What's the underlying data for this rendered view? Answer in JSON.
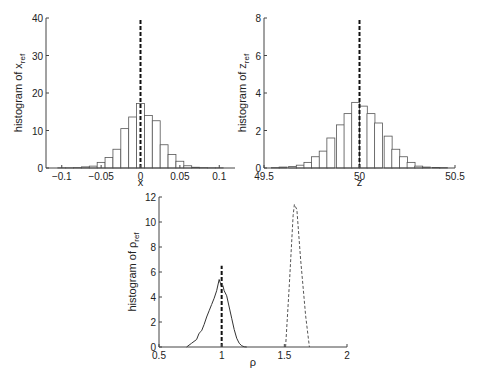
{
  "chart_data": [
    {
      "id": "hist_x",
      "type": "bar",
      "title": "",
      "xlabel": "x",
      "ylabel": "histogram of x",
      "ylabel_sub": "ref",
      "xlim": [
        -0.12,
        0.12
      ],
      "ylim": [
        0,
        40
      ],
      "xticks": [
        -0.1,
        -0.05,
        0,
        0.05,
        0.1
      ],
      "xtick_labels": [
        "-0.1",
        "-0.05",
        "0",
        "0.05",
        "0.1"
      ],
      "yticks": [
        0,
        10,
        20,
        30,
        40
      ],
      "ytick_labels": [
        "0",
        "10",
        "20",
        "30",
        "40"
      ],
      "grid": false,
      "bin_width": 0.01,
      "categories": [
        -0.1,
        -0.09,
        -0.08,
        -0.07,
        -0.06,
        -0.05,
        -0.04,
        -0.03,
        -0.02,
        -0.01,
        0,
        0.01,
        0.02,
        0.03,
        0.04,
        0.05,
        0.06,
        0.07,
        0.08,
        0.09,
        0.1
      ],
      "values": [
        0.05,
        0.05,
        0.1,
        0.3,
        0.5,
        1.5,
        2.8,
        5.0,
        10.5,
        13.6,
        17.2,
        14.0,
        12.6,
        6.2,
        3.6,
        1.8,
        0.6,
        0.2,
        0.1,
        0.05,
        0.05
      ],
      "reference_line": {
        "x": 0,
        "style": "dashed",
        "ymax": 40
      }
    },
    {
      "id": "hist_z",
      "type": "bar",
      "title": "",
      "xlabel": "z",
      "ylabel": "histogram of z",
      "ylabel_sub": "ref",
      "xlim": [
        49.5,
        50.5
      ],
      "ylim": [
        0,
        8
      ],
      "xticks": [
        49.5,
        50,
        50.5
      ],
      "xtick_labels": [
        "49.5",
        "50",
        "50.5"
      ],
      "yticks": [
        0,
        2,
        4,
        6,
        8
      ],
      "ytick_labels": [
        "0",
        "2",
        "4",
        "6",
        "8"
      ],
      "grid": false,
      "bin_width": 0.0417,
      "categories": [
        49.56,
        49.6,
        49.65,
        49.69,
        49.73,
        49.77,
        49.81,
        49.85,
        49.9,
        49.94,
        49.98,
        50.02,
        50.06,
        50.1,
        50.15,
        50.19,
        50.23,
        50.27,
        50.31,
        50.35,
        50.4,
        50.44
      ],
      "values": [
        0.02,
        0.05,
        0.08,
        0.15,
        0.3,
        0.6,
        0.9,
        1.6,
        2.3,
        2.9,
        3.5,
        3.3,
        2.9,
        2.4,
        1.7,
        1.0,
        0.6,
        0.3,
        0.1,
        0.05,
        0.03,
        0.02
      ],
      "reference_line": {
        "x": 50,
        "style": "dashed",
        "ymax": 8
      }
    },
    {
      "id": "hist_rho",
      "type": "line",
      "title": "",
      "xlabel": "ρ",
      "ylabel": "histogram of ρ",
      "ylabel_sub": "ref",
      "xlim": [
        0.5,
        2
      ],
      "ylim": [
        0,
        12
      ],
      "xticks": [
        0.5,
        1,
        1.5,
        2
      ],
      "xtick_labels": [
        "0.5",
        "1",
        "1.5",
        "2"
      ],
      "yticks": [
        0,
        2,
        4,
        6,
        8,
        10,
        12
      ],
      "ytick_labels": [
        "0",
        "2",
        "4",
        "6",
        "8",
        "10",
        "12"
      ],
      "grid": false,
      "series": [
        {
          "name": "solid",
          "style": "solid",
          "x": [
            0.72,
            0.76,
            0.8,
            0.82,
            0.84,
            0.86,
            0.88,
            0.9,
            0.92,
            0.94,
            0.96,
            0.98,
            0.99,
            1.0,
            1.01,
            1.02,
            1.04,
            1.06,
            1.08,
            1.1,
            1.12,
            1.14,
            1.16,
            1.18,
            1.2
          ],
          "y": [
            0.0,
            0.3,
            0.6,
            1.1,
            1.3,
            1.8,
            2.4,
            2.9,
            3.4,
            3.9,
            4.5,
            5.4,
            5.1,
            4.8,
            4.9,
            4.5,
            4.1,
            3.2,
            2.3,
            1.4,
            0.7,
            0.3,
            0.1,
            0.02,
            0.0
          ]
        },
        {
          "name": "dashed",
          "style": "dashed",
          "x": [
            1.51,
            1.54,
            1.57,
            1.58,
            1.6,
            1.63,
            1.67,
            1.7
          ],
          "y": [
            0.0,
            5.0,
            10.5,
            11.4,
            11.0,
            7.0,
            2.5,
            0.0
          ]
        }
      ],
      "reference_line": {
        "x": 1,
        "style": "dashed",
        "ymax": 6.5
      }
    }
  ]
}
